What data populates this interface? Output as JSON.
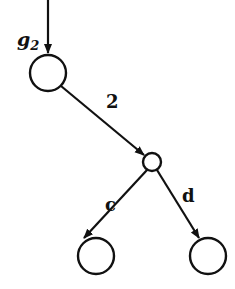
{
  "diagram": {
    "type": "tree",
    "nodes": [
      {
        "id": "root",
        "cx": 48,
        "cy": 73,
        "r": 18
      },
      {
        "id": "mid",
        "cx": 152,
        "cy": 162,
        "r": 9
      },
      {
        "id": "left",
        "cx": 96,
        "cy": 256,
        "r": 18
      },
      {
        "id": "right",
        "cx": 208,
        "cy": 256,
        "r": 18
      }
    ],
    "edges": [
      {
        "id": "incoming",
        "from": "top",
        "to": "root",
        "label": "g",
        "label_sub": "2"
      },
      {
        "id": "root-mid",
        "from": "root",
        "to": "mid",
        "label": "2"
      },
      {
        "id": "mid-left",
        "from": "mid",
        "to": "left",
        "label": "c"
      },
      {
        "id": "mid-right",
        "from": "mid",
        "to": "right",
        "label": "d"
      }
    ]
  }
}
